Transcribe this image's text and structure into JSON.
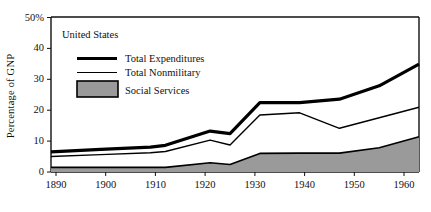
{
  "chart_data": {
    "type": "area",
    "title": "",
    "subtitle": "",
    "region_label": "United States",
    "xlabel": "",
    "ylabel": "Percentage of GNP",
    "xlim": [
      1890,
      1964
    ],
    "ylim": [
      0,
      50
    ],
    "grid": false,
    "legend_position": "top-left-inside",
    "x_ticks": [
      1890,
      1900,
      1910,
      1920,
      1930,
      1940,
      1950,
      1960
    ],
    "x_tick_labels": [
      "1890",
      "1900",
      "1910",
      "1920",
      "1930",
      "1940",
      "1950",
      "1960"
    ],
    "y_ticks": [
      0,
      10,
      20,
      30,
      40,
      50
    ],
    "y_tick_labels": [
      "0",
      "10",
      "20",
      "30",
      "40",
      "50%"
    ],
    "x": [
      1890,
      1900,
      1910,
      1913,
      1922,
      1926,
      1932,
      1940,
      1948,
      1956,
      1964
    ],
    "series": [
      {
        "name": "Total Expenditures",
        "style": "thick-line",
        "color": "#000000",
        "values": [
          6.5,
          7.3,
          8.0,
          8.6,
          13.2,
          12.4,
          22.4,
          22.4,
          23.5,
          27.8,
          34.8
        ]
      },
      {
        "name": "Total Nonmilitary",
        "style": "thin-line",
        "color": "#000000",
        "values": [
          5.0,
          5.6,
          6.2,
          6.6,
          10.3,
          8.7,
          18.4,
          19.1,
          14.1,
          17.5,
          20.9
        ]
      },
      {
        "name": "Social Services",
        "style": "filled-area",
        "color": "#9a9a9a",
        "values": [
          1.5,
          1.5,
          1.5,
          1.5,
          3.0,
          2.4,
          6.0,
          6.1,
          6.1,
          7.8,
          11.4
        ]
      }
    ]
  },
  "legend": {
    "region": "United States",
    "entries": [
      {
        "label": "Total Expenditures",
        "swatch": "thick-line-swatch"
      },
      {
        "label": "Total Nonmilitary",
        "swatch": "thin-line-swatch"
      },
      {
        "label": "Social Services",
        "swatch": "gray-box-swatch"
      }
    ]
  },
  "axes": {
    "y_axis_title": "Percentage of GNP",
    "y_labels": [
      "50%",
      "40",
      "30",
      "20",
      "10",
      "0"
    ],
    "x_labels": [
      "1890",
      "1900",
      "1910",
      "1920",
      "1930",
      "1940",
      "1950",
      "1960"
    ]
  },
  "colors": {
    "axis": "#111111",
    "line": "#000000",
    "fill": "#9a9a9a",
    "fill_border": "#000000",
    "background": "#ffffff"
  }
}
